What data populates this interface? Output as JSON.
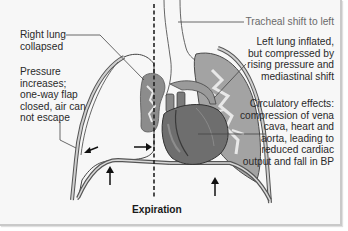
{
  "figure": {
    "phase_label": "Expiration",
    "colors": {
      "background": "#f7f7f7",
      "lung_fill": "#9a9a9a",
      "lung_light": "#e4e4e4",
      "heart_fill": "#6e6e6e",
      "outline": "#3a3a3a",
      "leader_line": "#444444"
    },
    "labels": {
      "right_lung": "Right lung\ncollapsed",
      "pressure": "Pressure\nincreases;\none-way flap\nclosed, air can\nnot escape",
      "tracheal_shift": "Tracheal shift to left",
      "left_lung": "Left lung inflated,\nbut compressed by\nrising pressure and\nmediastinal shift",
      "circulatory": "Circulatory effects:\ncompression of vena\ncava, heart and\naorta, leading to\nreduced cardiac\noutput and fall in BP"
    },
    "arrows": [
      {
        "name": "pleural-pressure-arrow",
        "direction": "down-left"
      },
      {
        "name": "mediastinal-shift-arrow",
        "direction": "right"
      },
      {
        "name": "right-diaphragm-arrow",
        "direction": "up"
      },
      {
        "name": "left-diaphragm-arrow",
        "direction": "up"
      }
    ],
    "midline": "dashed vertical midline"
  }
}
